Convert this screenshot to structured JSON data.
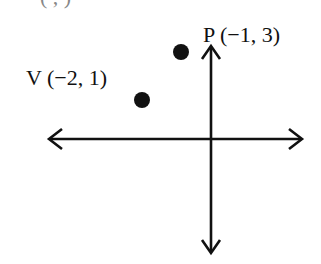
{
  "figure": {
    "type": "coordinate-plane-sketch",
    "top_caption_cutoff": "(   ,   )",
    "axes": {
      "horizontal": {
        "arrows": "both"
      },
      "vertical": {
        "arrows": "both"
      }
    },
    "points": [
      {
        "name": "P",
        "x": -1,
        "y": 3,
        "label": "P (−1, 3)"
      },
      {
        "name": "V",
        "x": -2,
        "y": 1,
        "label": "V (−2, 1)"
      }
    ],
    "colors": {
      "ink": "#111111",
      "background": "#ffffff"
    }
  }
}
